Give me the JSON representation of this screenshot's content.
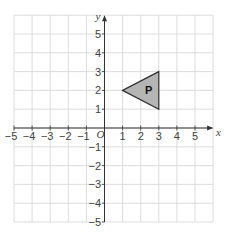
{
  "diagram": {
    "type": "coordinate-grid",
    "x_axis": {
      "label": "x",
      "min": -5,
      "max": 5,
      "ticks": [
        "−5",
        "−4",
        "−3",
        "−2",
        "−1",
        "1",
        "2",
        "3",
        "4",
        "5"
      ]
    },
    "y_axis": {
      "label": "y",
      "min": -5,
      "max": 5,
      "ticks": [
        "5",
        "4",
        "3",
        "2",
        "1",
        "−1",
        "−2",
        "−3",
        "−4",
        "−5"
      ]
    },
    "origin_label": "O",
    "shape": {
      "name": "P",
      "vertices": [
        [
          1,
          2
        ],
        [
          3,
          3
        ],
        [
          3,
          1
        ]
      ],
      "fill": "#b5b5b5",
      "stroke": "#333333"
    },
    "colors": {
      "grid": "#d9d9d9",
      "axis": "#333333",
      "text": "#444444"
    }
  }
}
